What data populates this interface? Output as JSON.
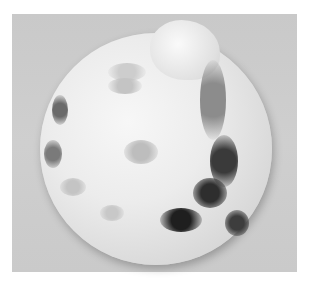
{
  "image": {
    "description": "Photograph of a spherical object covered in white fuzzy mold with dark grey-black patches, on a light grey background",
    "background_color": "#cbcbcb",
    "subject_color": "#ececec",
    "dark_patch_color": "#2a2a2a",
    "spots": [
      {
        "x": 52,
        "y": 95,
        "w": 16,
        "h": 30,
        "c": "#6a6a6a"
      },
      {
        "x": 44,
        "y": 140,
        "w": 18,
        "h": 28,
        "c": "#7a7a7a"
      },
      {
        "x": 108,
        "y": 63,
        "w": 38,
        "h": 18,
        "c": "#cdcdcd"
      },
      {
        "x": 108,
        "y": 78,
        "w": 34,
        "h": 16,
        "c": "#c4c4c4"
      },
      {
        "x": 124,
        "y": 140,
        "w": 34,
        "h": 24,
        "c": "#bdbdbd"
      },
      {
        "x": 60,
        "y": 178,
        "w": 26,
        "h": 18,
        "c": "#c4c4c4"
      },
      {
        "x": 100,
        "y": 205,
        "w": 24,
        "h": 16,
        "c": "#c8c8c8"
      },
      {
        "x": 160,
        "y": 208,
        "w": 42,
        "h": 24,
        "c": "#1f1f1f"
      },
      {
        "x": 193,
        "y": 178,
        "w": 34,
        "h": 30,
        "c": "#2e2e2e"
      },
      {
        "x": 210,
        "y": 135,
        "w": 28,
        "h": 52,
        "c": "#3a3a3a"
      },
      {
        "x": 225,
        "y": 210,
        "w": 24,
        "h": 26,
        "c": "#3d3d3d"
      },
      {
        "x": 200,
        "y": 60,
        "w": 26,
        "h": 80,
        "c": "#8c8c8c"
      }
    ]
  }
}
